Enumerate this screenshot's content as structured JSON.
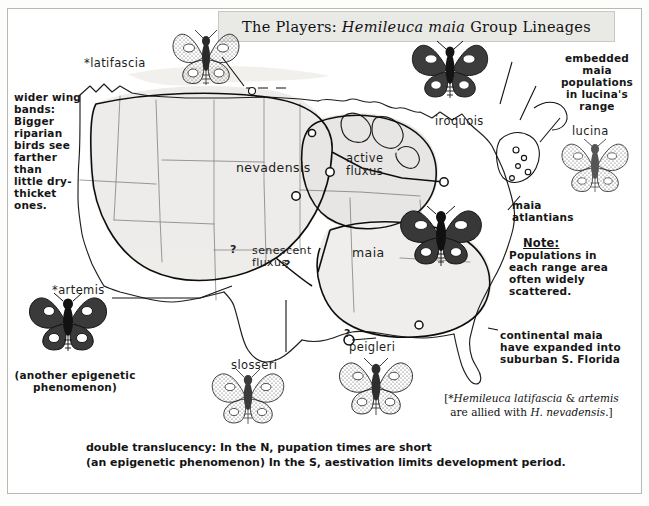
{
  "title": {
    "prefix": "The Players: ",
    "italic": "Hemileuca maia",
    "suffix": " Group Lineages"
  },
  "annotations": {
    "wider_wing_bands": "wider wing\nbands:\nBigger\nriparian\nbirds see\nfarther\nthan\nlittle dry-\nthicket\nones.",
    "embedded_maia": "embedded\nmaia\npopulations\nin lucina's\nrange",
    "maia_atlantians": "maia\natlantians",
    "note_label": "Note:",
    "note_body": "Populations in\neach range area\noften widely\nscattered.",
    "continental_maia": "continental maia\nhave expanded into\nsuburban S. Florida",
    "another_epigenetic": "(another epigenetic\nphenomenon)"
  },
  "bracket_note": {
    "open": "[*",
    "italic1": "Hemileuca latifascia",
    "mid": " & ",
    "italic2": "artemis",
    "line2_pre": "are allied with ",
    "italic3": "H. nevadensis",
    "close": ".]"
  },
  "caption": {
    "line1": "double translucency:  In the N, pupation times are short",
    "line2": "(an epigenetic phenomenon) In the S, aestivation limits development period."
  },
  "map_labels": [
    {
      "id": "latifascia",
      "text": "*latifascia"
    },
    {
      "id": "nevadensis",
      "text": "nevadensis"
    },
    {
      "id": "active-fluxus",
      "text": "active\nfluxus"
    },
    {
      "id": "iroquois",
      "text": "iroquois"
    },
    {
      "id": "lucina",
      "text": "lucina"
    },
    {
      "id": "maia",
      "text": "maia"
    },
    {
      "id": "senescent-fluxus",
      "text": "senescent\nfluxus"
    },
    {
      "id": "artemis",
      "text": "*artemis"
    },
    {
      "id": "slosseri",
      "text": "slosseri"
    },
    {
      "id": "peigleri",
      "text": "peigleri"
    }
  ],
  "query_marks": [
    "?",
    "?",
    "?"
  ],
  "moths": [
    {
      "id": "latifascia-moth",
      "shade": "light"
    },
    {
      "id": "iroquois-moth",
      "shade": "dark"
    },
    {
      "id": "lucina-moth",
      "shade": "light"
    },
    {
      "id": "maia-moth",
      "shade": "dark"
    },
    {
      "id": "artemis-moth",
      "shade": "dark"
    },
    {
      "id": "slosseri-moth",
      "shade": "light"
    },
    {
      "id": "peigleri-moth",
      "shade": "medium"
    }
  ],
  "colors": {
    "paper": "#ffffff",
    "ink": "#1a1a1a",
    "frame": "#b8b8b4",
    "title_panel": "#e9e9e6",
    "range_fill": "#e2e0dd",
    "fluxus_fill": "#d6d4d0"
  }
}
